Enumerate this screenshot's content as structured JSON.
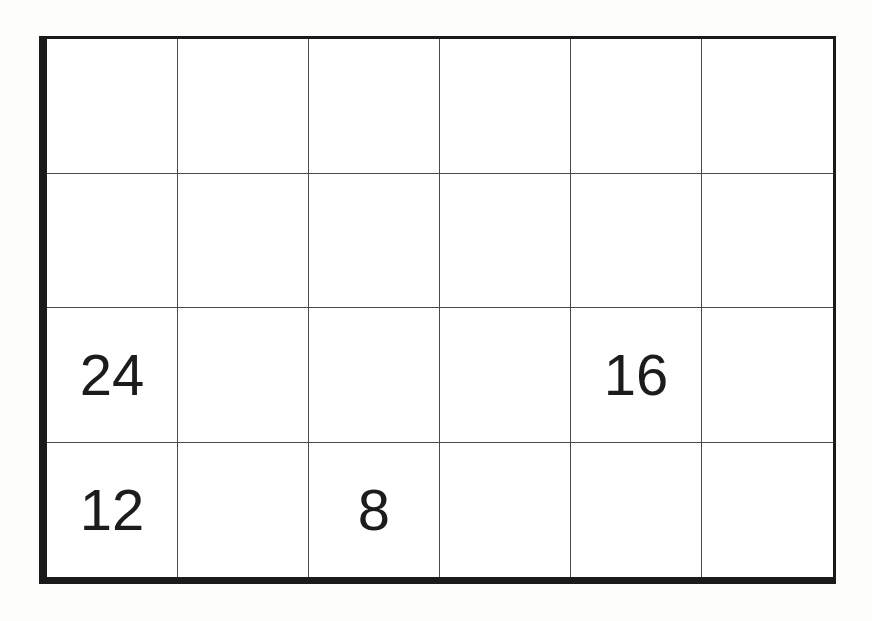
{
  "grid": {
    "rows": 4,
    "cols": 6,
    "cells": [
      [
        "",
        "",
        "",
        "",
        "",
        ""
      ],
      [
        "",
        "",
        "",
        "",
        "",
        ""
      ],
      [
        "24",
        "",
        "",
        "",
        "16",
        ""
      ],
      [
        "12",
        "",
        "8",
        "",
        "",
        ""
      ]
    ]
  },
  "colors": {
    "border_outer": "#1a1a1a",
    "border_inner": "#4a4a4a",
    "text": "#1c1c1c",
    "paper": "#fdfdfc"
  }
}
